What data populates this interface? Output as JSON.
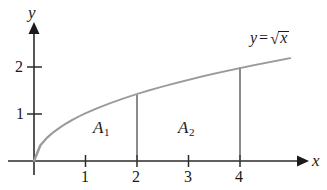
{
  "figure": {
    "type": "math-graph",
    "title_label": "y = √x",
    "background_color": "#ffffff",
    "axis_color": "#1a1a1a",
    "curve_color": "#9a9a9a",
    "drop_line_color": "#555555",
    "text_color": "#1a1a1a"
  },
  "axes": {
    "x_axis_name": "x",
    "y_axis_name": "y",
    "x_ticks": [
      {
        "value": 1,
        "label": "1"
      },
      {
        "value": 2,
        "label": "2"
      },
      {
        "value": 3,
        "label": "3"
      },
      {
        "value": 4,
        "label": "4"
      }
    ],
    "y_ticks": [
      {
        "value": 1,
        "label": "1"
      },
      {
        "value": 2,
        "label": "2"
      }
    ],
    "origin_px": {
      "x": 34,
      "y": 161
    },
    "x_unit_px": 51.5,
    "y_unit_px": 47,
    "x_range": [
      0,
      5.2
    ],
    "y_range": [
      0,
      2.85
    ],
    "grid": false
  },
  "curve": {
    "equation_label": "y = √x",
    "equation_lhs": "y",
    "equation_operator": "=",
    "radical_sign": "√",
    "radical_argument": "x",
    "function": "sqrt",
    "domain": [
      0,
      4.97
    ],
    "points": [
      {
        "x": 0,
        "y": 0
      },
      {
        "x": 0.25,
        "y": 0.5
      },
      {
        "x": 0.5,
        "y": 0.707
      },
      {
        "x": 1,
        "y": 1
      },
      {
        "x": 1.5,
        "y": 1.225
      },
      {
        "x": 2,
        "y": 1.414
      },
      {
        "x": 2.5,
        "y": 1.581
      },
      {
        "x": 3,
        "y": 1.732
      },
      {
        "x": 3.5,
        "y": 1.871
      },
      {
        "x": 4,
        "y": 2
      },
      {
        "x": 4.5,
        "y": 2.121
      },
      {
        "x": 4.97,
        "y": 2.229
      }
    ]
  },
  "drop_lines": [
    {
      "at_x": 2,
      "from_y": 0,
      "to_y": 1.414
    },
    {
      "at_x": 4,
      "from_y": 0,
      "to_y": 2
    }
  ],
  "regions": [
    {
      "name": "A1",
      "label_base": "A",
      "label_sub": "1",
      "x_start": 1,
      "x_end": 2
    },
    {
      "name": "A2",
      "label_base": "A",
      "label_sub": "2",
      "x_start": 2,
      "x_end": 4
    }
  ]
}
